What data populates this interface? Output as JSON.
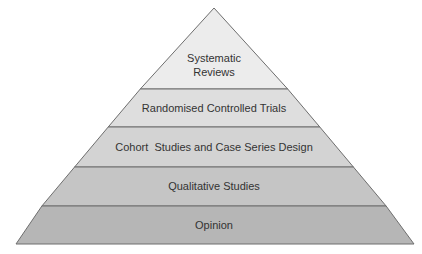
{
  "diagram": {
    "type": "pyramid",
    "title": "",
    "levels": [
      {
        "label_lines": [
          "Systematic",
          "Reviews"
        ],
        "color": "#ececec"
      },
      {
        "label_lines": [
          "Randomised Controlled Trials"
        ],
        "color": "#dedede"
      },
      {
        "label_lines": [
          "Cohort  Studies and Case Series Design"
        ],
        "color": "#d3d3d3"
      },
      {
        "label_lines": [
          "Qualitative Studies"
        ],
        "color": "#c5c5c5"
      },
      {
        "label_lines": [
          "Opinion"
        ],
        "color": "#b6b6b6"
      }
    ],
    "outline_color": "#6e6e6e"
  }
}
